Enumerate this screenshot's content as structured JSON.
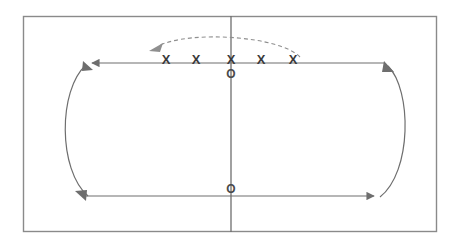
{
  "canvas": {
    "width": 463,
    "height": 245,
    "background": "#ffffff"
  },
  "frame": {
    "name": "outer-frame",
    "x": 23,
    "y": 16,
    "width": 414,
    "height": 216,
    "stroke": "#8a8a8a",
    "stroke_width": 1.4
  },
  "axis": {
    "vertical": {
      "x": 231,
      "y1": 16,
      "y2": 232,
      "stroke": "#6e6e6e"
    },
    "top_line": {
      "y": 63,
      "x1": 88,
      "x2": 385,
      "stroke": "#6e6e6e",
      "direction": "left"
    },
    "bottom_line": {
      "y": 196,
      "x1": 80,
      "x2": 378,
      "stroke": "#6e6e6e",
      "direction": "right"
    }
  },
  "arcs": {
    "left": {
      "label": "left-turnaround-arc",
      "bulge": "left",
      "stroke": "#6e6e6e",
      "arrow_top": "up-right",
      "arrow_bottom": "down-right"
    },
    "right": {
      "label": "right-turnaround-arc",
      "bulge": "right",
      "stroke": "#6e6e6e",
      "arrow_top": "up-left"
    },
    "dashed": {
      "label": "dashed-return-arc",
      "stroke": "#8f8f8f",
      "dash": "4 3",
      "arrow": "left"
    }
  },
  "marks": {
    "cross_label": "X",
    "node_label": "O",
    "crosses": [
      {
        "label": "X",
        "x": 166,
        "y": 61
      },
      {
        "label": "X",
        "x": 196,
        "y": 61
      },
      {
        "label": "X",
        "x": 231,
        "y": 61
      },
      {
        "label": "X",
        "x": 261,
        "y": 61
      },
      {
        "label": "X",
        "x": 293,
        "y": 61
      }
    ],
    "nodes": [
      {
        "label": "O",
        "x": 231,
        "y": 74
      },
      {
        "label": "O",
        "x": 231,
        "y": 190
      }
    ]
  },
  "colors": {
    "ink": "#6e6e6e",
    "frame": "#8a8a8a",
    "text": "#3a3a3a",
    "dashed": "#8f8f8f",
    "background": "#ffffff"
  }
}
